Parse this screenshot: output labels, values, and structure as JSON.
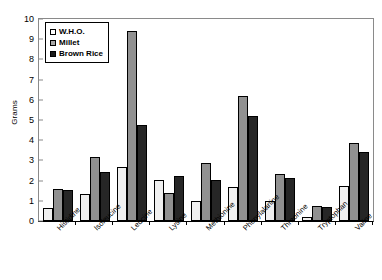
{
  "chart_data": {
    "type": "bar",
    "title": "",
    "xlabel": "",
    "ylabel": "Grams",
    "ylim": [
      0,
      10
    ],
    "ytick_step": 1,
    "yticks": [
      "10",
      "9",
      "8",
      "7",
      "6",
      "5",
      "4",
      "3",
      "2",
      "1",
      "0"
    ],
    "grid": false,
    "legend_position": "top-left",
    "categories": [
      "Histidine",
      "Isoleucine",
      "Leucine",
      "Lysine",
      "Methionine",
      "Phenylalanine",
      "Threonine",
      "Tryptophan",
      "Valine"
    ],
    "series": [
      {
        "name": "W.H.O.",
        "color": "#f0f0f0",
        "values": [
          0.65,
          1.35,
          2.65,
          2.05,
          1.0,
          1.7,
          1.0,
          0.2,
          1.75
        ]
      },
      {
        "name": "Millet",
        "color": "#919191",
        "values": [
          1.6,
          3.15,
          9.4,
          1.4,
          2.85,
          6.2,
          2.35,
          0.75,
          3.85
        ]
      },
      {
        "name": "Brown Rice",
        "color": "#262626",
        "values": [
          1.55,
          2.45,
          4.75,
          2.25,
          2.05,
          5.2,
          2.15,
          0.7,
          3.4
        ]
      }
    ]
  }
}
